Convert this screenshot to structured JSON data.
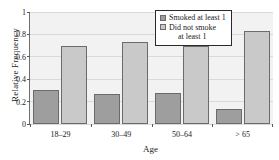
{
  "figure": {
    "title_strip": "",
    "background_color": "#ffffff",
    "plot_background_color": "#f2f2f2"
  },
  "legend": {
    "position": "top-right",
    "items": [
      {
        "label": "Smoked at least 1",
        "label_line2": "",
        "color": "#9e9e9e",
        "swatch": "legend-swatch-smoked"
      },
      {
        "label": "Did not smoke",
        "label_line2": "at least 1",
        "color": "#c9c9c9",
        "swatch": "legend-swatch-not-smoked"
      }
    ]
  },
  "axes": {
    "y": {
      "label": "Relative Frequency",
      "ticks": [
        "0",
        "0.2",
        "0.4",
        "0.6",
        "0.8",
        "1"
      ],
      "min": 0,
      "max": 1
    },
    "x": {
      "label": "Age",
      "ticks": [
        "18–29",
        "30–49",
        "50–64",
        "> 65"
      ]
    }
  },
  "chart_data": {
    "type": "bar",
    "title": "",
    "xlabel": "Age",
    "ylabel": "Relative Frequency",
    "categories": [
      "18–29",
      "30–49",
      "50–64",
      "> 65"
    ],
    "series": [
      {
        "name": "Smoked at least 1",
        "color": "#9e9e9e",
        "values": [
          0.3,
          0.27,
          0.28,
          0.13
        ]
      },
      {
        "name": "Did not smoke at least 1",
        "color": "#c9c9c9",
        "values": [
          0.7,
          0.73,
          0.7,
          0.83
        ]
      }
    ],
    "ylim": [
      0,
      1
    ],
    "yticks": [
      0,
      0.2,
      0.4,
      0.6,
      0.8,
      1
    ],
    "grid": true,
    "grid_axis": "y",
    "legend_position": "upper right",
    "grouping": "grouped"
  }
}
